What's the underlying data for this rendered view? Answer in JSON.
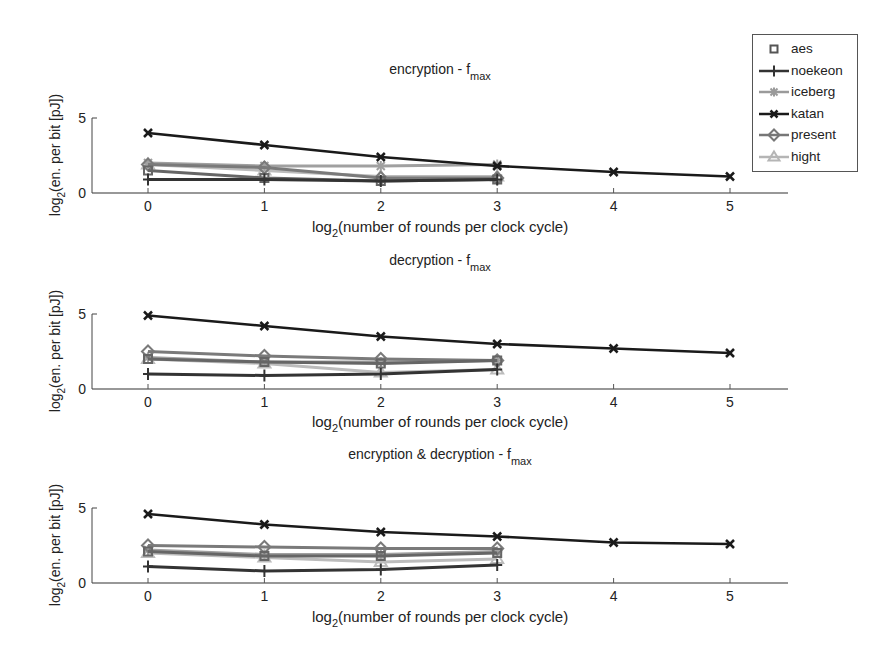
{
  "chart_data": [
    {
      "type": "line",
      "title": "encryption - f",
      "title_sub": "max",
      "xlabel": "log",
      "xlabel_sub": "2",
      "xlabel_rest": "(number of rounds per clock cycle)",
      "ylabel": "log2(en. per bit [pJ])",
      "xlim": [
        -0.5,
        5.5
      ],
      "ylim": [
        0,
        5
      ],
      "xticks": [
        0,
        1,
        2,
        3,
        4,
        5
      ],
      "yticks": [
        0,
        5
      ],
      "grid": false,
      "series": [
        {
          "name": "aes",
          "x": [
            0,
            1,
            2,
            3
          ],
          "values": [
            1.5,
            1.0,
            0.8,
            0.9
          ]
        },
        {
          "name": "noekeon",
          "x": [
            0,
            1,
            2,
            3
          ],
          "values": [
            0.9,
            0.9,
            0.8,
            0.9
          ]
        },
        {
          "name": "iceberg",
          "x": [
            0,
            1,
            2,
            3
          ],
          "values": [
            2.0,
            1.8,
            1.8,
            1.9
          ]
        },
        {
          "name": "katan",
          "x": [
            0,
            1,
            2,
            3,
            4,
            5
          ],
          "values": [
            4.0,
            3.2,
            2.4,
            1.8,
            1.4,
            1.1
          ]
        },
        {
          "name": "present",
          "x": [
            0,
            1,
            2,
            3
          ],
          "values": [
            1.9,
            1.7,
            1.0,
            1.0
          ]
        },
        {
          "name": "hight",
          "x": [
            0,
            1,
            2,
            3
          ],
          "values": [
            1.9,
            1.5,
            1.1,
            1.1
          ]
        }
      ]
    },
    {
      "type": "line",
      "title": "decryption - f",
      "title_sub": "max",
      "xlabel": "log",
      "xlabel_sub": "2",
      "xlabel_rest": "(number of rounds per clock cycle)",
      "ylabel": "log2(en. per bit [pJ])",
      "xlim": [
        -0.5,
        5.5
      ],
      "ylim": [
        0,
        5
      ],
      "xticks": [
        0,
        1,
        2,
        3,
        4,
        5
      ],
      "yticks": [
        0,
        5
      ],
      "grid": false,
      "series": [
        {
          "name": "aes",
          "x": [
            0,
            1,
            2,
            3
          ],
          "values": [
            2.0,
            1.8,
            1.7,
            1.9
          ]
        },
        {
          "name": "noekeon",
          "x": [
            0,
            1,
            2,
            3
          ],
          "values": [
            1.0,
            0.9,
            1.0,
            1.3
          ]
        },
        {
          "name": "iceberg",
          "x": [
            0,
            1,
            2,
            3
          ],
          "values": [
            2.1,
            1.8,
            1.8,
            1.9
          ]
        },
        {
          "name": "katan",
          "x": [
            0,
            1,
            2,
            3,
            4,
            5
          ],
          "values": [
            4.9,
            4.2,
            3.5,
            3.0,
            2.7,
            2.4
          ]
        },
        {
          "name": "present",
          "x": [
            0,
            1,
            2,
            3
          ],
          "values": [
            2.5,
            2.2,
            2.0,
            1.9
          ]
        },
        {
          "name": "hight",
          "x": [
            0,
            1,
            2,
            3
          ],
          "values": [
            2.0,
            1.7,
            1.1,
            1.3
          ]
        }
      ]
    },
    {
      "type": "line",
      "title": "encryption & decryption - f",
      "title_sub": "max",
      "xlabel": "log",
      "xlabel_sub": "2",
      "xlabel_rest": "(number of rounds per clock cycle)",
      "ylabel": "log2(en. per bit [pJ])",
      "xlim": [
        -0.5,
        5.5
      ],
      "ylim": [
        0,
        5
      ],
      "xticks": [
        0,
        1,
        2,
        3,
        4,
        5
      ],
      "yticks": [
        0,
        5
      ],
      "grid": false,
      "series": [
        {
          "name": "aes",
          "x": [
            0,
            1,
            2,
            3
          ],
          "values": [
            2.1,
            1.8,
            1.8,
            2.0
          ]
        },
        {
          "name": "noekeon",
          "x": [
            0,
            1,
            2,
            3
          ],
          "values": [
            1.1,
            0.8,
            0.9,
            1.2
          ]
        },
        {
          "name": "iceberg",
          "x": [
            0,
            1,
            2,
            3
          ],
          "values": [
            2.2,
            1.9,
            1.9,
            2.1
          ]
        },
        {
          "name": "katan",
          "x": [
            0,
            1,
            2,
            3,
            4,
            5
          ],
          "values": [
            4.6,
            3.9,
            3.4,
            3.1,
            2.7,
            2.6
          ]
        },
        {
          "name": "present",
          "x": [
            0,
            1,
            2,
            3
          ],
          "values": [
            2.5,
            2.4,
            2.3,
            2.3
          ]
        },
        {
          "name": "hight",
          "x": [
            0,
            1,
            2,
            3
          ],
          "values": [
            2.0,
            1.7,
            1.4,
            1.6
          ]
        }
      ]
    }
  ],
  "legend": {
    "position": "top-right",
    "items": [
      {
        "name": "aes",
        "marker": "square",
        "color": "#555555",
        "line": false
      },
      {
        "name": "noekeon",
        "marker": "plus",
        "color": "#333333",
        "line": true
      },
      {
        "name": "iceberg",
        "marker": "star",
        "color": "#9a9a9a",
        "line": true
      },
      {
        "name": "katan",
        "marker": "x",
        "color": "#1a1a1a",
        "line": true
      },
      {
        "name": "present",
        "marker": "diamond",
        "color": "#777777",
        "line": true
      },
      {
        "name": "hight",
        "marker": "triangle",
        "color": "#b5b5b5",
        "line": true
      }
    ]
  },
  "series_colors": {
    "aes": "#666666",
    "noekeon": "#333333",
    "iceberg": "#a0a0a0",
    "katan": "#1a1a1a",
    "present": "#7a7a7a",
    "hight": "#bcbcbc"
  }
}
